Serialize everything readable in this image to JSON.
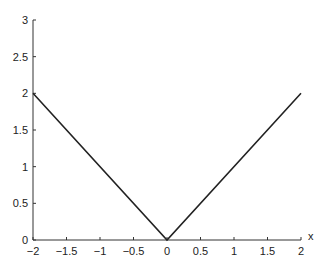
{
  "chart_data": {
    "type": "line",
    "title": "",
    "xlabel": "x",
    "ylabel": "",
    "xlim": [
      -2,
      2
    ],
    "ylim": [
      0,
      3
    ],
    "grid": false,
    "legend": null,
    "x_ticks": [
      -2,
      -1.5,
      -1,
      -0.5,
      0,
      0.5,
      1,
      1.5,
      2
    ],
    "x_tick_labels": [
      "−2",
      "−1.5",
      "−1",
      "−0.5",
      "0",
      "0.5",
      "1",
      "1.5",
      "2"
    ],
    "y_ticks": [
      0,
      0.5,
      1,
      1.5,
      2,
      2.5,
      3
    ],
    "y_tick_labels": [
      "0",
      "0.5",
      "1",
      "1.5",
      "2",
      "2.5",
      "3"
    ],
    "series": [
      {
        "name": "|x|",
        "x": [
          -2,
          0,
          2
        ],
        "y": [
          2,
          0,
          2
        ],
        "color": "#222222"
      }
    ]
  },
  "colors": {
    "axis": "#333333",
    "line": "#222222",
    "background": "#ffffff"
  }
}
